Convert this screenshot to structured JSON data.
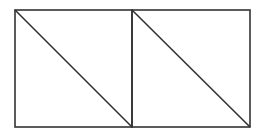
{
  "diagram": {
    "stroke_color": "#333333",
    "background": "#ffffff",
    "shapes": [
      {
        "type": "square",
        "x": 15,
        "y": 10,
        "size": 117,
        "diagonal": "top-left to bottom-right"
      },
      {
        "type": "square",
        "x": 132,
        "y": 10,
        "size": 118,
        "diagonal": "top-left to bottom-right"
      }
    ]
  }
}
